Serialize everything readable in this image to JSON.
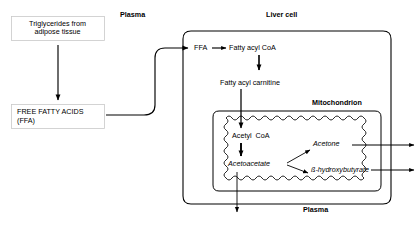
{
  "diagram": {
    "compartments": {
      "plasma_top_label": "Plasma",
      "plasma_bottom_label": "Plasma",
      "liver_cell_label": "Liver cell",
      "mitochondrion_label": "Mitochondrion"
    },
    "boxes": [
      {
        "id": "triglycerides",
        "line1": "Triglycerides from",
        "line2": "adipose tissue"
      },
      {
        "id": "free-fatty-acids",
        "line1": "FREE FATTY ACIDS",
        "line2": "(FFA)"
      }
    ],
    "nodes": [
      {
        "id": "ffa",
        "label": "FFA",
        "style": "plain"
      },
      {
        "id": "fatty-acyl-coa",
        "label": "Fatty acyl CoA",
        "style": "plain"
      },
      {
        "id": "fatty-acyl-carnitine",
        "label": "Fatty acyl carnitine",
        "style": "plain"
      },
      {
        "id": "acetyl-coa",
        "label": "Acetyl  CoA",
        "style": "plain"
      },
      {
        "id": "acetoacetate",
        "label": "Acetoacetate",
        "style": "italic"
      },
      {
        "id": "acetone",
        "label": "Acetone",
        "style": "italic"
      },
      {
        "id": "beta-hydroxybutyrate",
        "label": "ß-hydroxybutyrate",
        "style": "italic"
      }
    ],
    "colors": {
      "stroke": "#000000",
      "background": "#ffffff",
      "box_border": "#b8b8b8"
    }
  }
}
